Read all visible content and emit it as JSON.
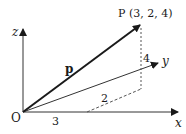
{
  "diagram": {
    "point_label": "P (3, 2, 4)",
    "vector_label": "p",
    "origin_label": "O",
    "axes": {
      "x": "x",
      "y": "y",
      "z": "z"
    },
    "components": {
      "x": "3",
      "y": "2",
      "z": "4"
    },
    "colors": {
      "ink": "#1a1a1a",
      "dashed": "#555555"
    }
  }
}
